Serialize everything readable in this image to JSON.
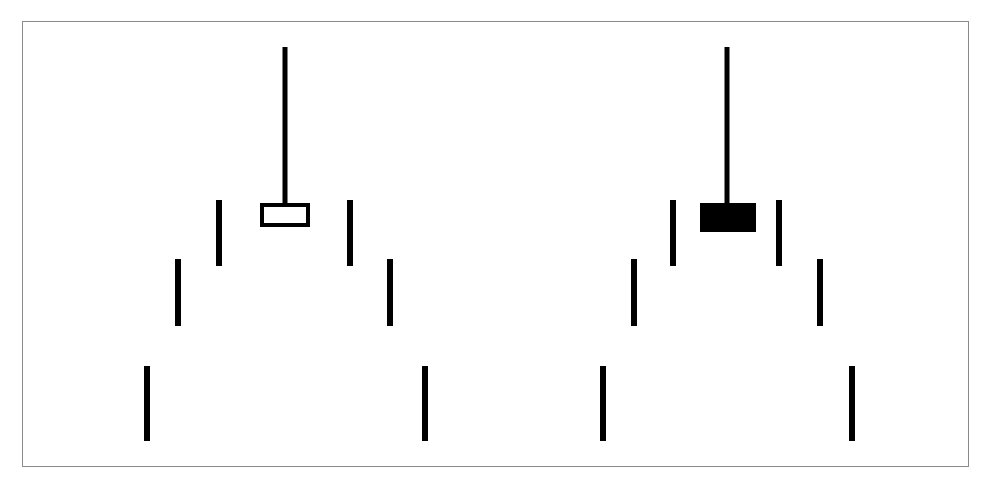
{
  "figure": {
    "title": "Two hanging mobile diagrams with candlestick-style vertical bars",
    "background_color": "#ffffff",
    "stroke_color": "#000000",
    "frame": {
      "label": "figure-border",
      "x": 22,
      "y": 21,
      "width": 947,
      "height": 446,
      "border_color": "#8a8a8a",
      "border_width": 1,
      "fill": "#ffffff"
    }
  },
  "chart_data": {
    "type": "scatter",
    "title": "Two hanging mobile diagrams with candlestick-style vertical bars",
    "subtitle": "",
    "xlabel": "",
    "ylabel": "",
    "xlim": [
      0,
      991
    ],
    "ylim": [
      489,
      0
    ],
    "grid": false,
    "legend": "none",
    "annotations": [],
    "tick_labels": {
      "x": [],
      "y": []
    },
    "groups": [
      {
        "name": "left-mobile",
        "body_fill": "none",
        "body_label": "hollow-rectangle",
        "stem": {
          "x": 285,
          "y_top": 47,
          "y_bottom": 206,
          "width": 5
        },
        "body": {
          "x": 260,
          "y": 203,
          "width": 50,
          "height": 24,
          "stroke_width": 4,
          "filled": false
        },
        "bars": [
          {
            "name": "inner-left-bar",
            "x": 219,
            "y_top": 200,
            "y_bottom": 266,
            "width": 6
          },
          {
            "name": "inner-right-bar",
            "x": 350,
            "y_top": 200,
            "y_bottom": 266,
            "width": 6
          },
          {
            "name": "mid-left-bar",
            "x": 178,
            "y_top": 259,
            "y_bottom": 326,
            "width": 6
          },
          {
            "name": "mid-right-bar",
            "x": 390,
            "y_top": 259,
            "y_bottom": 326,
            "width": 6
          },
          {
            "name": "outer-left-bar",
            "x": 147,
            "y_top": 366,
            "y_bottom": 441,
            "width": 6
          },
          {
            "name": "outer-right-bar",
            "x": 425,
            "y_top": 366,
            "y_bottom": 441,
            "width": 6
          }
        ]
      },
      {
        "name": "right-mobile",
        "body_fill": "#000000",
        "body_label": "filled-rectangle",
        "stem": {
          "x": 727,
          "y_top": 47,
          "y_bottom": 206,
          "width": 5
        },
        "body": {
          "x": 700,
          "y": 203,
          "width": 56,
          "height": 29,
          "stroke_width": 4,
          "filled": true
        },
        "bars": [
          {
            "name": "inner-left-bar",
            "x": 673,
            "y_top": 200,
            "y_bottom": 266,
            "width": 6
          },
          {
            "name": "inner-right-bar",
            "x": 779,
            "y_top": 200,
            "y_bottom": 266,
            "width": 6
          },
          {
            "name": "mid-left-bar",
            "x": 634,
            "y_top": 259,
            "y_bottom": 326,
            "width": 6
          },
          {
            "name": "mid-right-bar",
            "x": 820,
            "y_top": 259,
            "y_bottom": 326,
            "width": 6
          },
          {
            "name": "outer-left-bar",
            "x": 603,
            "y_top": 366,
            "y_bottom": 441,
            "width": 6
          },
          {
            "name": "outer-right-bar",
            "x": 852,
            "y_top": 366,
            "y_bottom": 441,
            "width": 6
          }
        ]
      }
    ]
  }
}
